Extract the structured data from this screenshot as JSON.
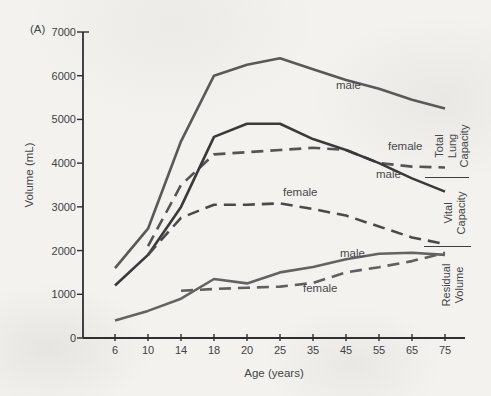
{
  "figure": {
    "panel_label": "(A)",
    "paper_color": "#f3f2ef",
    "axis_color": "#2f2f31"
  },
  "chart_data": {
    "type": "line",
    "xlabel": "Age (years)",
    "ylabel": "Volume (mL)",
    "ylim": [
      0,
      7000
    ],
    "grid": false,
    "legend_position": "labels-on-lines",
    "x_tick_labels": [
      "6",
      "10",
      "14",
      "18",
      "20",
      "25",
      "35",
      "45",
      "55",
      "65",
      "75"
    ],
    "y_tick_labels": [
      "0",
      "1000",
      "2000",
      "3000",
      "4000",
      "5000",
      "6000",
      "7000"
    ],
    "series": [
      {
        "name": "total-lung-capacity-male",
        "sex": "male",
        "measure": "Total Lung Capacity",
        "style": "solid",
        "color": "#59595b",
        "points": [
          [
            6,
            1600
          ],
          [
            10,
            2500
          ],
          [
            14,
            4500
          ],
          [
            18,
            6000
          ],
          [
            20,
            6250
          ],
          [
            25,
            6400
          ],
          [
            35,
            6150
          ],
          [
            45,
            5900
          ],
          [
            55,
            5700
          ],
          [
            65,
            5450
          ],
          [
            75,
            5250
          ]
        ]
      },
      {
        "name": "total-lung-capacity-female",
        "sex": "female",
        "measure": "Total Lung Capacity",
        "style": "dashed",
        "color": "#545557",
        "points": [
          [
            10,
            2100
          ],
          [
            14,
            3500
          ],
          [
            18,
            4200
          ],
          [
            20,
            4250
          ],
          [
            25,
            4300
          ],
          [
            35,
            4350
          ],
          [
            45,
            4300
          ],
          [
            55,
            4000
          ],
          [
            65,
            3920
          ],
          [
            75,
            3900
          ]
        ]
      },
      {
        "name": "vital-capacity-male",
        "sex": "male",
        "measure": "Vital Capacity",
        "style": "solid",
        "color": "#3a3a3c",
        "points": [
          [
            6,
            1200
          ],
          [
            10,
            1900
          ],
          [
            14,
            3000
          ],
          [
            18,
            4600
          ],
          [
            20,
            4900
          ],
          [
            25,
            4900
          ],
          [
            35,
            4550
          ],
          [
            45,
            4300
          ],
          [
            55,
            4000
          ],
          [
            65,
            3650
          ],
          [
            75,
            3350
          ]
        ]
      },
      {
        "name": "vital-capacity-female",
        "sex": "female",
        "measure": "Vital Capacity",
        "style": "dashed",
        "color": "#4a4a4c",
        "points": [
          [
            10,
            1900
          ],
          [
            14,
            2750
          ],
          [
            18,
            3050
          ],
          [
            20,
            3050
          ],
          [
            25,
            3080
          ],
          [
            35,
            2950
          ],
          [
            45,
            2800
          ],
          [
            55,
            2550
          ],
          [
            65,
            2300
          ],
          [
            75,
            2150
          ]
        ]
      },
      {
        "name": "residual-volume-male",
        "sex": "male",
        "measure": "Residual Volume",
        "style": "solid",
        "color": "#626365",
        "points": [
          [
            6,
            400
          ],
          [
            10,
            620
          ],
          [
            14,
            900
          ],
          [
            18,
            1350
          ],
          [
            20,
            1250
          ],
          [
            25,
            1500
          ],
          [
            35,
            1625
          ],
          [
            45,
            1800
          ],
          [
            55,
            1925
          ],
          [
            65,
            1950
          ],
          [
            75,
            1900
          ]
        ]
      },
      {
        "name": "residual-volume-female",
        "sex": "female",
        "measure": "Residual Volume",
        "style": "dashed",
        "color": "#5e5f61",
        "points": [
          [
            14,
            1080
          ],
          [
            18,
            1120
          ],
          [
            20,
            1150
          ],
          [
            25,
            1175
          ],
          [
            35,
            1260
          ],
          [
            45,
            1500
          ],
          [
            55,
            1620
          ],
          [
            65,
            1760
          ],
          [
            75,
            1950
          ]
        ]
      }
    ],
    "curve_labels": [
      {
        "text": "male",
        "x": 336,
        "y": 80,
        "series": "total-lung-capacity-male"
      },
      {
        "text": "female",
        "x": 388,
        "y": 141,
        "series": "total-lung-capacity-female"
      },
      {
        "text": "male",
        "x": 376,
        "y": 169,
        "series": "vital-capacity-male"
      },
      {
        "text": "female",
        "x": 283,
        "y": 187,
        "series": "vital-capacity-female"
      },
      {
        "text": "male",
        "x": 340,
        "y": 248,
        "series": "residual-volume-male"
      },
      {
        "text": "female",
        "x": 303,
        "y": 283,
        "series": "residual-volume-female"
      }
    ],
    "right_labels": [
      {
        "text": "Total\nLung\nCapacity",
        "cx": 452,
        "cy": 146
      },
      {
        "text": "Vital\nCapacity",
        "cx": 455,
        "cy": 213
      },
      {
        "text": "Residual\nVolume",
        "cx": 453,
        "cy": 285
      }
    ],
    "right_separators": [
      {
        "x": 425,
        "y": 177,
        "w": 44
      },
      {
        "x": 424,
        "y": 246,
        "w": 47
      }
    ]
  }
}
